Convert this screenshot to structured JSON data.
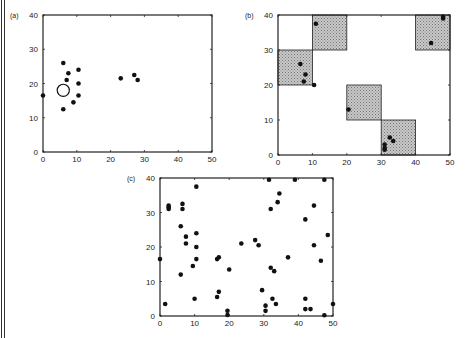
{
  "chart_data": [
    {
      "type": "scatter",
      "panel_label": "(a)",
      "title": "",
      "xlabel": "",
      "ylabel": "",
      "xlim": [
        0,
        50
      ],
      "ylim": [
        0,
        40
      ],
      "xticks": [
        0,
        10,
        20,
        30,
        40,
        50
      ],
      "yticks": [
        0,
        10,
        20,
        30,
        40
      ],
      "grid": false,
      "points": [
        [
          0,
          16.5
        ],
        [
          6,
          26
        ],
        [
          7.5,
          23
        ],
        [
          7,
          21
        ],
        [
          10.5,
          24
        ],
        [
          10.5,
          20
        ],
        [
          10.5,
          16.5
        ],
        [
          9,
          14.5
        ],
        [
          6,
          12.5
        ],
        [
          23,
          21.5
        ],
        [
          27,
          22.5
        ],
        [
          28,
          21
        ]
      ],
      "open_circle": {
        "x": 6,
        "y": 18,
        "r_units": 1.8
      }
    },
    {
      "type": "scatter",
      "panel_label": "(b)",
      "title": "",
      "xlabel": "",
      "ylabel": "",
      "xlim": [
        0,
        50
      ],
      "ylim": [
        0,
        40
      ],
      "xticks": [
        0,
        10,
        20,
        30,
        40,
        50
      ],
      "yticks": [
        0,
        10,
        20,
        30,
        40
      ],
      "grid": false,
      "shaded_cells": [
        {
          "x0": 0,
          "x1": 10,
          "y0": 20,
          "y1": 30
        },
        {
          "x0": 10,
          "x1": 20,
          "y0": 30,
          "y1": 40
        },
        {
          "x0": 20,
          "x1": 30,
          "y0": 10,
          "y1": 20
        },
        {
          "x0": 30,
          "x1": 40,
          "y0": 0,
          "y1": 10
        },
        {
          "x0": 40,
          "x1": 50,
          "y0": 30,
          "y1": 40
        }
      ],
      "points": [
        [
          11,
          37.5
        ],
        [
          6.5,
          26
        ],
        [
          8,
          23
        ],
        [
          7.5,
          21
        ],
        [
          10.5,
          20
        ],
        [
          20.5,
          13
        ],
        [
          32.5,
          5
        ],
        [
          33.5,
          4
        ],
        [
          31,
          3
        ],
        [
          31,
          2
        ],
        [
          31,
          1.5
        ],
        [
          44.5,
          32
        ],
        [
          48,
          39.5
        ],
        [
          48,
          39
        ]
      ]
    },
    {
      "type": "scatter",
      "panel_label": "(c)",
      "title": "",
      "xlabel": "",
      "ylabel": "",
      "xlim": [
        0,
        50
      ],
      "ylim": [
        0,
        40
      ],
      "xticks": [
        0,
        10,
        20,
        30,
        40,
        50
      ],
      "yticks": [
        0,
        10,
        20,
        30,
        40
      ],
      "grid": false,
      "points": [
        [
          0,
          16.5
        ],
        [
          1.5,
          3.5
        ],
        [
          2.5,
          32
        ],
        [
          2.5,
          31.5
        ],
        [
          2.5,
          31
        ],
        [
          6,
          12
        ],
        [
          6.5,
          32.5
        ],
        [
          6.5,
          31
        ],
        [
          6,
          26
        ],
        [
          7.5,
          23
        ],
        [
          7.5,
          21
        ],
        [
          9.5,
          14.5
        ],
        [
          10,
          5
        ],
        [
          10.5,
          37.5
        ],
        [
          10.5,
          24
        ],
        [
          10.5,
          20
        ],
        [
          10.5,
          16.5
        ],
        [
          16.5,
          16.5
        ],
        [
          17,
          17
        ],
        [
          16.5,
          5.5
        ],
        [
          17,
          7
        ],
        [
          19.5,
          1.5
        ],
        [
          19.5,
          0.3
        ],
        [
          20,
          13.5
        ],
        [
          23.5,
          21
        ],
        [
          27.5,
          22
        ],
        [
          28.5,
          20.5
        ],
        [
          29.5,
          7.5
        ],
        [
          30.5,
          3
        ],
        [
          30.5,
          1.5
        ],
        [
          31.5,
          39.5
        ],
        [
          32,
          31
        ],
        [
          32,
          14
        ],
        [
          32.5,
          5
        ],
        [
          33,
          13
        ],
        [
          34,
          33
        ],
        [
          33.5,
          3.5
        ],
        [
          34.5,
          35.5
        ],
        [
          37,
          17
        ],
        [
          39,
          39.5
        ],
        [
          42,
          28
        ],
        [
          42,
          5
        ],
        [
          42,
          2
        ],
        [
          43.5,
          2
        ],
        [
          44.5,
          32
        ],
        [
          44.5,
          20.5
        ],
        [
          46.5,
          16
        ],
        [
          47.5,
          0.2
        ],
        [
          47.5,
          39.5
        ],
        [
          48.5,
          23.5
        ],
        [
          50,
          3.5
        ]
      ]
    }
  ],
  "layout": {
    "panels": [
      {
        "x0px": 43,
        "x1px": 212,
        "y0px": 152,
        "y1px": 15
      },
      {
        "x0px": 278,
        "x1px": 450,
        "y0px": 155,
        "y1px": 15
      },
      {
        "x0px": 160,
        "x1px": 333,
        "y0px": 316,
        "y1px": 178
      }
    ],
    "colors": {
      "ink": "#111111",
      "shade": "#b8b8b8",
      "frame": "#222222"
    }
  }
}
